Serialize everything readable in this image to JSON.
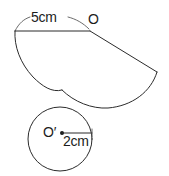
{
  "figure": {
    "background_color": "#ffffff",
    "stroke_color": "#2b2b2b",
    "thin_stroke_color": "#5a5a5a",
    "label_color": "#1c1c1c",
    "width": 169,
    "height": 176
  },
  "labels": {
    "slant_measure": "5cm",
    "apex_point": "O",
    "circle_center": "O′",
    "circle_radius_measure": "2cm"
  },
  "sector": {
    "apex_label": "O",
    "apex_point": {
      "x": 90,
      "y": 31
    },
    "left_point": {
      "x": 15,
      "y": 31
    },
    "right_point": {
      "x": 157,
      "y": 72
    },
    "measure_label": "5cm",
    "measure_value": 5,
    "measure_unit": "cm",
    "chord_y": 31
  },
  "circle": {
    "center_label": "O′",
    "center": {
      "x": 60,
      "y": 139
    },
    "radius_px": 32,
    "radius_label": "2cm",
    "radius_value": 2,
    "radius_unit": "cm",
    "radius_line": {
      "x1": 62,
      "y1": 133,
      "x2": 92,
      "y2": 133
    }
  }
}
